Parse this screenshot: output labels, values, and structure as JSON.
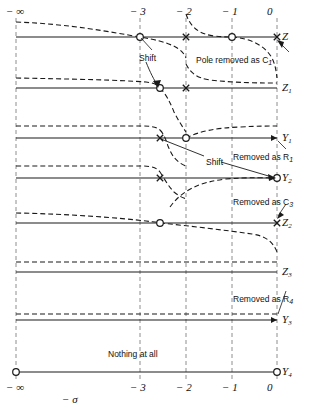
{
  "figure": {
    "type": "pole-zero-removal-diagram",
    "xlabel": "− σ",
    "x_ticks": [
      {
        "label": "− ∞",
        "x": 16
      },
      {
        "label": "− 3",
        "x": 140
      },
      {
        "label": "− 2",
        "x": 186
      },
      {
        "label": "− 1",
        "x": 232
      },
      {
        "label": "0",
        "x": 277
      }
    ],
    "axis_rows": [
      {
        "name": "Z",
        "label": "Z",
        "y": 37
      },
      {
        "name": "Z1",
        "label": "Z",
        "sub": "1",
        "y": 88
      },
      {
        "name": "Y1",
        "label": "Y",
        "sub": "1",
        "y": 138
      },
      {
        "name": "Y2",
        "label": "Y",
        "sub": "2",
        "y": 178
      },
      {
        "name": "Z2",
        "label": "Z",
        "sub": "2",
        "y": 223
      },
      {
        "name": "Z3",
        "label": "Z",
        "sub": "3",
        "y": 272
      },
      {
        "name": "Y3",
        "label": "Y",
        "sub": "3",
        "y": 320
      },
      {
        "name": "Y4",
        "label": "Y",
        "sub": "4",
        "y": 372
      }
    ],
    "annotations": [
      {
        "name": "shift-top",
        "text": "Shift",
        "x": 139,
        "y": 54
      },
      {
        "name": "shift-middle",
        "text": "Shift",
        "x": 206,
        "y": 158
      },
      {
        "name": "pole-removed-c1",
        "text": "Pole removed as C",
        "sub": "1",
        "x": 196,
        "y": 56
      },
      {
        "name": "removed-r1",
        "text": "Removed as R",
        "sub": "1",
        "x": 233,
        "y": 153
      },
      {
        "name": "removed-c3",
        "text": "Removed as C",
        "sub": "3",
        "x": 233,
        "y": 198
      },
      {
        "name": "removed-r4",
        "text": "Removed as R",
        "sub": "4",
        "x": 233,
        "y": 295
      },
      {
        "name": "nothing-at-all",
        "text": "Nothing at all",
        "x": 108,
        "y": 350
      }
    ],
    "markers": {
      "Z": [
        {
          "t": "zero",
          "x": 140
        },
        {
          "t": "pole",
          "x": 186
        },
        {
          "t": "zero",
          "x": 232
        },
        {
          "t": "pole",
          "x": 277
        }
      ],
      "Z1": [
        {
          "t": "zero",
          "x": 160
        },
        {
          "t": "pole",
          "x": 186
        }
      ],
      "Y1": [
        {
          "t": "pole",
          "x": 160
        },
        {
          "t": "zero",
          "x": 186
        },
        {
          "t": "arrow",
          "x": 277
        }
      ],
      "Y2": [
        {
          "t": "pole",
          "x": 160
        },
        {
          "t": "zero",
          "x": 277
        }
      ],
      "Z2": [
        {
          "t": "zero",
          "x": 160
        },
        {
          "t": "pole",
          "x": 277
        }
      ],
      "Z3": [],
      "Y3": [
        {
          "t": "arrow",
          "x": 277
        }
      ],
      "Y4": [
        {
          "t": "zero",
          "x": 16
        },
        {
          "t": "zero",
          "x": 277
        }
      ]
    },
    "colors": {
      "line": "#1a1a1a",
      "grid": "#8e8e8e",
      "text": "#111111"
    }
  }
}
